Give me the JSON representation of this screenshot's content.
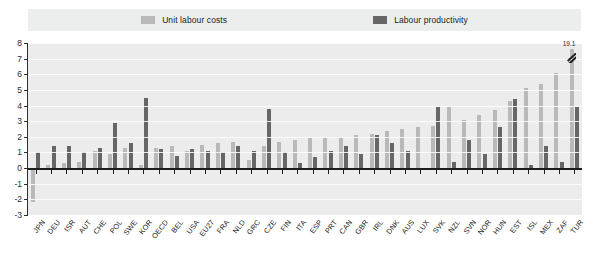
{
  "legend": {
    "items": [
      {
        "label": "Unit labour costs",
        "color": "#b9b9b9",
        "key": "ulc"
      },
      {
        "label": "Labour productivity",
        "color": "#666666",
        "key": "lp"
      }
    ]
  },
  "axis": {
    "y_ticks": [
      "8",
      "7",
      "6",
      "5",
      "4",
      "3",
      "2",
      "1",
      "0",
      "-1",
      "-2",
      "-3"
    ]
  },
  "annotation": {
    "tur_value": "19.1"
  },
  "chart_data": {
    "type": "bar",
    "title": "",
    "subtitle": "",
    "xlabel": "",
    "ylabel": "",
    "ylim": [
      -3,
      8
    ],
    "grid": true,
    "legend_position": "top-center",
    "orientation": "vertical",
    "note": "Last category TUR has a broken bar; its Unit labour costs value is 19.1 and is drawn truncated.",
    "categories": [
      "JPN",
      "DEU",
      "ISR",
      "AUT",
      "CHE",
      "POL",
      "SWE",
      "KOR",
      "OECD",
      "BEL",
      "USA",
      "EU27",
      "FRA",
      "NLD",
      "GRC",
      "CZE",
      "FIN",
      "ITA",
      "ESP",
      "PRT",
      "CAN",
      "GBR",
      "IRL",
      "DNK",
      "AUS",
      "LUX",
      "SVK",
      "NZL",
      "SVN",
      "NOR",
      "HUN",
      "EST",
      "ISL",
      "MEX",
      "ZAF",
      "TUR"
    ],
    "series": [
      {
        "name": "Unit labour costs",
        "color": "#b9b9b9",
        "values": [
          -2.2,
          0.2,
          0.3,
          0.4,
          1.1,
          0.9,
          1.3,
          0.2,
          1.3,
          1.4,
          1.1,
          1.5,
          1.6,
          1.7,
          0.5,
          1.4,
          1.7,
          1.8,
          1.9,
          1.9,
          2.0,
          2.1,
          2.2,
          2.4,
          2.5,
          2.6,
          2.7,
          3.9,
          3.1,
          3.4,
          3.7,
          4.3,
          5.1,
          5.4,
          6.1,
          19.1
        ],
        "broken_index": 35,
        "broken_drawn_value": 7.6
      },
      {
        "name": "Labour productivity",
        "color": "#666666",
        "values": [
          1.0,
          1.4,
          1.4,
          1.0,
          1.3,
          2.9,
          1.6,
          4.5,
          1.2,
          0.8,
          1.2,
          1.1,
          1.0,
          1.4,
          1.1,
          3.8,
          1.0,
          0.3,
          0.7,
          1.1,
          1.4,
          0.9,
          2.1,
          1.6,
          1.1,
          -0.1,
          3.9,
          0.4,
          1.8,
          0.9,
          2.6,
          4.4,
          0.2,
          1.4,
          0.4,
          3.9
        ]
      }
    ]
  }
}
